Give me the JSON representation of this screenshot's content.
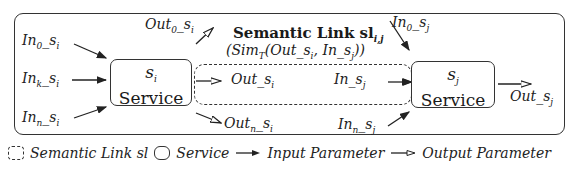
{
  "diagram": {
    "service_i": {
      "symbol": "s",
      "symbol_sub": "i",
      "label": "Service"
    },
    "service_j": {
      "symbol": "s",
      "symbol_sub": "j",
      "label": "Service"
    },
    "semantic_link": {
      "title": "Semantic Link sl",
      "title_sub": "i,j",
      "similarity": "(Sim",
      "similarity_sub": "T",
      "similarity_args": "(Out_s",
      "similarity_args_sub1": "i",
      "similarity_args_mid": ", In_s",
      "similarity_args_sub2": "j",
      "similarity_close": "))"
    },
    "inputs_i": [
      {
        "base": "In",
        "sub": "0",
        "tail": "_s",
        "tail_sub": "i"
      },
      {
        "base": "In",
        "sub": "k",
        "tail": "_s",
        "tail_sub": "i"
      },
      {
        "base": "In",
        "sub": "n",
        "tail": "_s",
        "tail_sub": "i"
      }
    ],
    "outputs_i": [
      {
        "base": "Out",
        "sub": "0",
        "tail": "_s",
        "tail_sub": "i"
      },
      {
        "base": "Out",
        "sub": "",
        "tail": "_s",
        "tail_sub": "i"
      },
      {
        "base": "Out",
        "sub": "n",
        "tail": "_s",
        "tail_sub": "i"
      }
    ],
    "inputs_j": [
      {
        "base": "In",
        "sub": "0",
        "tail": "_s",
        "tail_sub": "j"
      },
      {
        "base": "In",
        "sub": "",
        "tail": "_s",
        "tail_sub": "j"
      },
      {
        "base": "In",
        "sub": "n",
        "tail": "_s",
        "tail_sub": "j"
      }
    ],
    "outputs_j": [
      {
        "base": "Out",
        "sub": "",
        "tail": "_s",
        "tail_sub": "j"
      }
    ]
  },
  "legend": {
    "semantic_link": "Semantic Link sl",
    "service": "Service",
    "input_parameter": "Input Parameter",
    "output_parameter": "Output Parameter"
  }
}
